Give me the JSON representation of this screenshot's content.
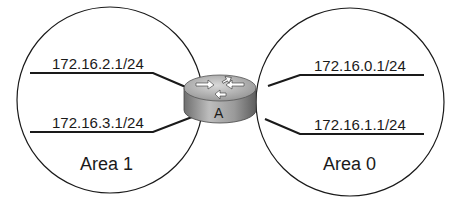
{
  "diagram": {
    "router": {
      "label": "A"
    },
    "areas": [
      {
        "name": "Area 1",
        "networks": [
          "172.16.2.1/24",
          "172.16.3.1/24"
        ]
      },
      {
        "name": "Area 0",
        "networks": [
          "172.16.0.1/24",
          "172.16.1.1/24"
        ]
      }
    ],
    "colors": {
      "line": "#1a1a1a",
      "router_top": "#b8b8b8",
      "router_body": "#8c8c8c"
    }
  }
}
